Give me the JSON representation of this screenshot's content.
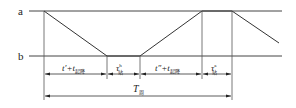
{
  "diagram": {
    "levels": {
      "top": "a",
      "bottom": "b"
    },
    "intervals": [
      {
        "label_main": "t′+t",
        "label_sub": "起降",
        "name": "interval-1"
      },
      {
        "label_main": "τ",
        "label_sup": "h",
        "label_sub": "站",
        "name": "interval-2"
      },
      {
        "label_main": "t″+t",
        "label_sub": "起降",
        "name": "interval-3"
      },
      {
        "label_main": "τ",
        "label_sup": "a",
        "label_sub": "站",
        "name": "interval-4"
      }
    ],
    "period": {
      "label_main": "T",
      "label_sub": "周"
    },
    "colors": {
      "line": "#333333",
      "text": "#222222",
      "background": "#ffffff"
    }
  }
}
